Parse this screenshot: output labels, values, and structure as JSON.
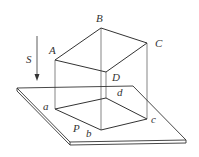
{
  "diagram": {
    "colors": {
      "line": "#333333",
      "background": "#ffffff"
    },
    "labels": {
      "upper_points": {
        "A": "A",
        "B": "B",
        "C": "C",
        "D": "D"
      },
      "projected_points": {
        "a": "a",
        "b": "b",
        "c": "c",
        "d": "d"
      },
      "plane": "P",
      "direction": "S"
    },
    "points": {
      "A": [
        55,
        60
      ],
      "B": [
        101,
        28
      ],
      "C": [
        147,
        43
      ],
      "D": [
        106,
        72
      ],
      "a": [
        55,
        109
      ],
      "b": [
        101,
        130
      ],
      "c": [
        147,
        119
      ],
      "d": [
        106,
        98
      ]
    },
    "plane_corners": [
      [
        17,
        88
      ],
      [
        133,
        86
      ],
      [
        186,
        140
      ],
      [
        70,
        142
      ]
    ],
    "arrow": {
      "from": [
        37,
        36
      ],
      "to": [
        37,
        80
      ]
    }
  }
}
